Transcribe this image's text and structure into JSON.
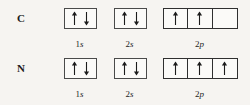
{
  "figure": {
    "background_color": "#f6f4f1",
    "line_color": "#2f2f2f",
    "text_color": "#1c1c1c"
  },
  "rows": [
    {
      "element": "C",
      "orbitals": [
        {
          "label_number": "1",
          "label_letter": "s",
          "name": "1s",
          "boxes": [
            {
              "spins": [
                "up",
                "down"
              ]
            }
          ]
        },
        {
          "label_number": "2",
          "label_letter": "s",
          "name": "2s",
          "boxes": [
            {
              "spins": [
                "up",
                "down"
              ]
            }
          ]
        },
        {
          "label_number": "2",
          "label_letter": "p",
          "name": "2p",
          "boxes": [
            {
              "spins": [
                "up"
              ]
            },
            {
              "spins": [
                "up"
              ]
            },
            {
              "spins": []
            }
          ]
        }
      ]
    },
    {
      "element": "N",
      "orbitals": [
        {
          "label_number": "1",
          "label_letter": "s",
          "name": "1s",
          "boxes": [
            {
              "spins": [
                "up",
                "down"
              ]
            }
          ]
        },
        {
          "label_number": "2",
          "label_letter": "s",
          "name": "2s",
          "boxes": [
            {
              "spins": [
                "up",
                "down"
              ]
            }
          ]
        },
        {
          "label_number": "2",
          "label_letter": "p",
          "name": "2p",
          "boxes": [
            {
              "spins": [
                "up"
              ]
            },
            {
              "spins": [
                "up"
              ]
            },
            {
              "spins": [
                "up"
              ]
            }
          ]
        }
      ]
    }
  ]
}
